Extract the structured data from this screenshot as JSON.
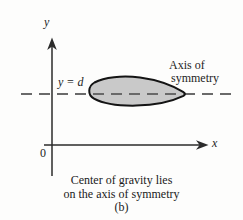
{
  "figure": {
    "subfigure_label": "(b)",
    "caption_line1": "Center of gravity lies",
    "caption_line2": "on the axis of symmetry",
    "axes": {
      "y_axis_label": "y",
      "x_axis_label": "x",
      "origin_label": "0"
    },
    "annotations": {
      "level_line_label": "y = d",
      "symmetry_label_line1": "Axis of",
      "symmetry_label_line2": "symmetry"
    },
    "colors": {
      "background": "#fdfdfc",
      "ink": "#242424",
      "axis": "#2b2b2b",
      "shape_fill": "#c9c9c9",
      "shape_stroke": "#141414",
      "dashed_line": "#3a3a3a"
    },
    "geometry": {
      "y_axis_x": 52,
      "x_axis_y": 145,
      "symmetry_line_y": 94,
      "symmetry_line_x_start": 21,
      "symmetry_line_x_end": 236,
      "shape_left_x": 88,
      "shape_right_x": 186
    }
  }
}
